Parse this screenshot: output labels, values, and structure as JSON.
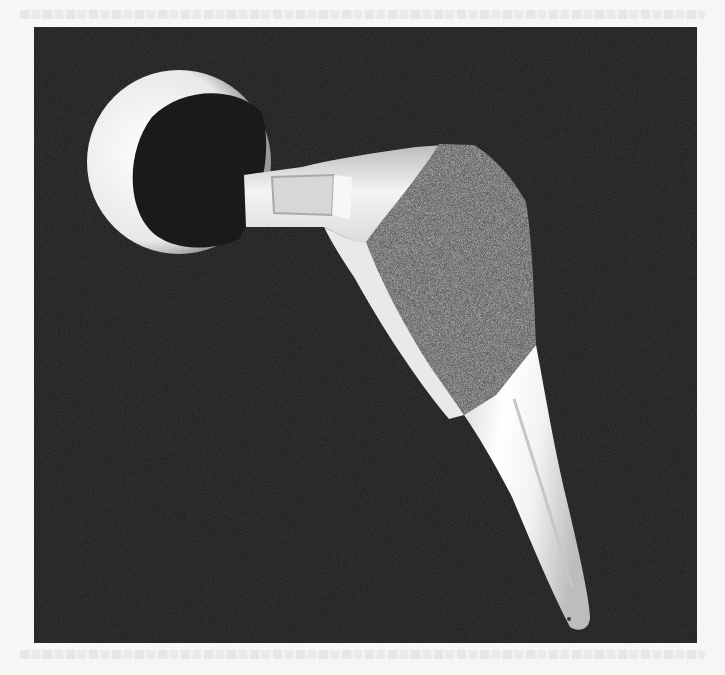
{
  "page": {
    "background_color": "#f6f6f6",
    "bleed_through_text_visible": true
  },
  "photo": {
    "subject": "hip implant femoral stem with modular head",
    "parts": [
      "femoral-head",
      "neck",
      "porous-coated-proximal-body",
      "polished-distal-stem"
    ],
    "background_color": "#1c1c1c",
    "metal_color": "#efefef",
    "coating_color": "#6e6e6e"
  }
}
